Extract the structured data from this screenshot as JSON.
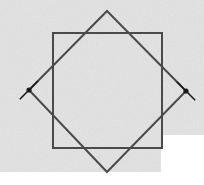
{
  "canvas": {
    "width": 204,
    "height": 185,
    "page_background": "#ffffff",
    "field_background": "#e3e3e3",
    "field": {
      "x": 0,
      "y": 0,
      "width": 161,
      "height": 172
    },
    "field_extension": {
      "x": 0,
      "y": 0,
      "width": 204,
      "height": 135
    },
    "noise_opacity": 0.16
  },
  "figure": {
    "stroke_color": "#4a4a4a",
    "stroke_width": 2,
    "marker_color": "#1a1a1a",
    "shapes": [
      {
        "name": "axis-aligned-square",
        "type": "square",
        "points": "53,33 162,33 162,148 53,148",
        "corners": [
          {
            "label": "top-left",
            "x": 53,
            "y": 33
          },
          {
            "label": "top-right",
            "x": 162,
            "y": 33
          },
          {
            "label": "bottom-right",
            "x": 162,
            "y": 148
          },
          {
            "label": "bottom-left",
            "x": 53,
            "y": 148
          }
        ],
        "side_length": 110
      },
      {
        "name": "rotated-square",
        "type": "square",
        "rotation_degrees": 45,
        "points": "107,11 186,91 107,172 29,90",
        "corners": [
          {
            "label": "top",
            "x": 107,
            "y": 11
          },
          {
            "label": "right",
            "x": 186,
            "y": 91
          },
          {
            "label": "bottom",
            "x": 107,
            "y": 172
          },
          {
            "label": "left",
            "x": 29,
            "y": 90
          }
        ],
        "diagonal_length": 161
      }
    ],
    "markers": [
      {
        "name": "left-vertex-marker",
        "type": "x-cross-with-dot",
        "x": 29,
        "y": 90,
        "arm_length": 13,
        "dot_radius": 2.6
      },
      {
        "name": "right-vertex-marker",
        "type": "x-cross-with-dot",
        "x": 186,
        "y": 91,
        "arm_length": 13,
        "dot_radius": 2.6
      }
    ]
  }
}
